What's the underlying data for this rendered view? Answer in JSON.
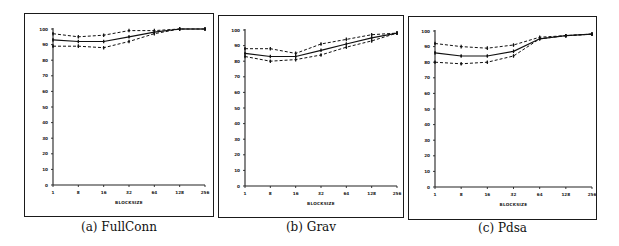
{
  "figure": {
    "panels": [
      {
        "id": "a",
        "caption": "(a) FullConn"
      },
      {
        "id": "b",
        "caption": "(b) Grav"
      },
      {
        "id": "c",
        "caption": "(c) Pdsa"
      }
    ]
  },
  "chart_data": [
    {
      "type": "line",
      "title": "(a) FullConn",
      "xlabel": "BLOCKSIZE",
      "ylabel": "",
      "categories": [
        "1",
        "8",
        "16",
        "32",
        "64",
        "128",
        "256"
      ],
      "yticks": [
        0,
        10,
        20,
        30,
        40,
        50,
        60,
        70,
        80,
        90,
        100
      ],
      "ylim": [
        0,
        100
      ],
      "grid": false,
      "series": [
        {
          "name": "upper",
          "style": "dashed",
          "values": [
            97,
            95,
            96,
            99,
            99,
            100,
            100
          ]
        },
        {
          "name": "mean",
          "style": "solid",
          "values": [
            93,
            92,
            92,
            95,
            98,
            100,
            100
          ]
        },
        {
          "name": "lower",
          "style": "dashed",
          "values": [
            89,
            89,
            88,
            92,
            97,
            100,
            100
          ]
        }
      ]
    },
    {
      "type": "line",
      "title": "(b) Grav",
      "xlabel": "BLOCKSIZE",
      "ylabel": "",
      "categories": [
        "1",
        "8",
        "16",
        "32",
        "64",
        "128",
        "256"
      ],
      "yticks": [
        0,
        10,
        20,
        30,
        40,
        50,
        60,
        70,
        80,
        90,
        100
      ],
      "ylim": [
        0,
        100
      ],
      "grid": false,
      "series": [
        {
          "name": "upper",
          "style": "dashed",
          "values": [
            88,
            88,
            85,
            91,
            94,
            97,
            98
          ]
        },
        {
          "name": "mean",
          "style": "solid",
          "values": [
            85,
            83,
            83,
            87,
            91,
            95,
            98
          ]
        },
        {
          "name": "lower",
          "style": "dashed",
          "values": [
            83,
            80,
            81,
            84,
            89,
            93,
            98
          ]
        }
      ]
    },
    {
      "type": "line",
      "title": "(c) Pdsa",
      "xlabel": "BLOCKSIZE",
      "ylabel": "",
      "categories": [
        "1",
        "8",
        "16",
        "32",
        "64",
        "128",
        "256"
      ],
      "yticks": [
        0,
        10,
        20,
        30,
        40,
        50,
        60,
        70,
        80,
        90,
        100
      ],
      "ylim": [
        0,
        100
      ],
      "grid": false,
      "series": [
        {
          "name": "upper",
          "style": "dashed",
          "values": [
            92,
            90,
            89,
            91,
            96,
            97,
            98
          ]
        },
        {
          "name": "mean",
          "style": "solid",
          "values": [
            86,
            84,
            84,
            87,
            95,
            97,
            98
          ]
        },
        {
          "name": "lower",
          "style": "dashed",
          "values": [
            80,
            79,
            80,
            84,
            95,
            97,
            98
          ]
        }
      ]
    }
  ]
}
